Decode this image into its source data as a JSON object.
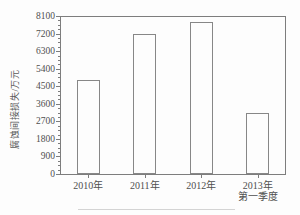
{
  "chart_data": {
    "type": "bar",
    "title": "",
    "categories": [
      "2010年",
      "2011年",
      "2012年",
      "2013年\n第一季度"
    ],
    "values": [
      4800,
      7200,
      7800,
      3150
    ],
    "xlabel": "",
    "ylabel": "腐蚀间接损失/万元",
    "ylim": [
      0,
      8100
    ],
    "ytick_step": 900,
    "yticks": [
      0,
      900,
      1800,
      2700,
      3600,
      4500,
      5400,
      6300,
      7200,
      8100
    ],
    "minor_ticks_per_interval": 3,
    "grid": "off",
    "legend": "none",
    "bar_style": "outlined-unfilled"
  },
  "colors": {
    "background": "#fdfdfd",
    "axis": "#7d7d7d",
    "bar_edge": "#878787",
    "text": "#4f4f4f",
    "page_line": "#d4d4d4"
  }
}
